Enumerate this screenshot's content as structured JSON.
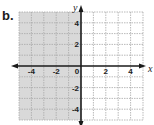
{
  "figure_label": "b.",
  "colors": {
    "shade": "#d9d9d9",
    "grid": "#a8a8a8",
    "axis": "#1a1a1a"
  },
  "chart_data": {
    "type": "inequality-graph",
    "title": "",
    "xlabel": "x",
    "ylabel": "y",
    "xlim": [
      -5,
      5
    ],
    "ylim": [
      -5,
      5
    ],
    "grid": true,
    "x_ticks": [
      -4,
      -2,
      0,
      2,
      4
    ],
    "y_ticks": [
      4,
      2,
      -2,
      -4
    ],
    "x_tick_labels": [
      "-4",
      "-2",
      "0",
      "2",
      "4"
    ],
    "y_tick_labels": [
      "4",
      "2",
      "-2",
      "-4"
    ],
    "shaded_region": {
      "description": "x < 0",
      "x_range": [
        -5,
        0
      ],
      "y_range": [
        -5,
        5
      ]
    },
    "boundary": {
      "line": "x = 0",
      "style": "solid"
    }
  }
}
